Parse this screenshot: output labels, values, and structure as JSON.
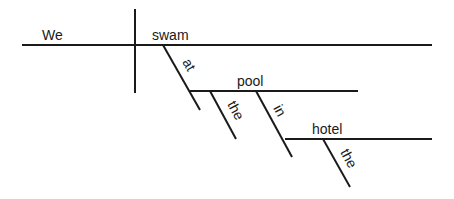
{
  "diagram": {
    "type": "sentence-diagram (Reed-Kellogg)",
    "sentence": "We swam at the pool in the hotel",
    "subject": "We",
    "verb": "swam",
    "modifiers": [
      {
        "word": "at",
        "role": "preposition",
        "attaches_to": "swam"
      },
      {
        "word": "pool",
        "role": "object of preposition"
      },
      {
        "word": "the",
        "role": "article",
        "attaches_to": "pool"
      },
      {
        "word": "in",
        "role": "preposition",
        "attaches_to": "pool"
      },
      {
        "word": "hotel",
        "role": "object of preposition"
      },
      {
        "word": "the",
        "role": "article",
        "attaches_to": "hotel"
      }
    ],
    "labels": {
      "subject": "We",
      "verb": "swam",
      "prep1": "at",
      "obj1": "pool",
      "art1": "the",
      "prep2": "in",
      "obj2": "hotel",
      "art2": "the"
    }
  }
}
